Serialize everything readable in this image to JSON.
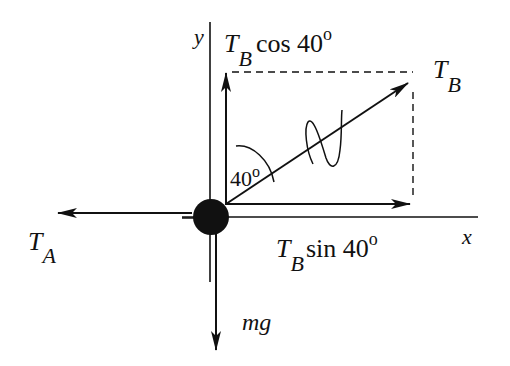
{
  "diagram": {
    "type": "free-body-diagram",
    "axes": {
      "x_label": "x",
      "y_label": "y"
    },
    "forces": {
      "tension_a": {
        "symbol": "T",
        "subscript": "A"
      },
      "tension_b": {
        "symbol": "T",
        "subscript": "B"
      },
      "tension_b_vertical": {
        "symbol": "T",
        "subscript": "B",
        "func": "cos 40",
        "degree": "o"
      },
      "tension_b_horizontal": {
        "symbol": "T",
        "subscript": "B",
        "func": "sin 40",
        "degree": "o"
      },
      "weight": {
        "label": "mg"
      }
    },
    "angle": {
      "value": "40",
      "degree": "o"
    },
    "colors": {
      "ink": "#111111",
      "background": "#ffffff"
    }
  }
}
